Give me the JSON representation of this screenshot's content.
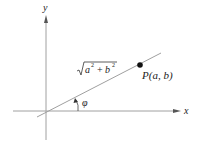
{
  "diagram": {
    "type": "coordinate-plane",
    "axes": {
      "x_label": "x",
      "y_label": "y"
    },
    "vector": {
      "magnitude_label": "√(a² + b²)",
      "magnitude_radicand_a": "a",
      "magnitude_radicand_b": "b",
      "magnitude_exp": "2",
      "magnitude_plus": "+",
      "point_label": "P(a, b)",
      "angle_label": "φ"
    },
    "colors": {
      "axis": "#9a9a9a",
      "line": "#9a9a9a",
      "point": "#111111",
      "text": "#222222"
    }
  }
}
